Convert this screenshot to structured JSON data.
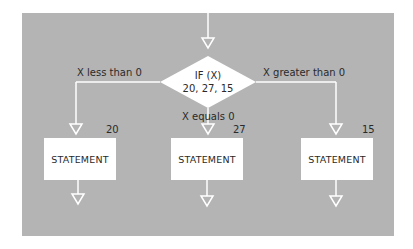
{
  "diagram": {
    "type": "flowchart",
    "colors": {
      "panel": "#b4b4b4",
      "shape_fill": "#ffffff",
      "line": "#ffffff",
      "text": "#2a2a2a"
    },
    "decision": {
      "line1": "IF (X)",
      "line2": "20, 27, 15"
    },
    "branches": [
      {
        "condition": "X less than 0",
        "target_label": "20",
        "statement": "STATEMENT"
      },
      {
        "condition": "X equals 0",
        "target_label": "27",
        "statement": "STATEMENT"
      },
      {
        "condition": "X greater than 0",
        "target_label": "15",
        "statement": "STATEMENT"
      }
    ]
  }
}
